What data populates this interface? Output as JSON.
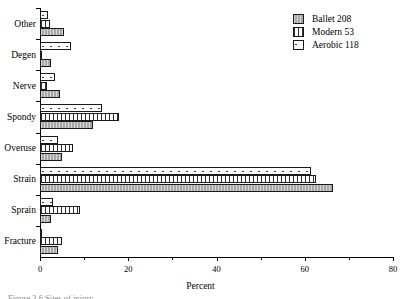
{
  "chart_data": {
    "type": "bar",
    "orientation": "horizontal",
    "title": "",
    "xlabel": "Percent",
    "ylabel": "",
    "xlim": [
      0,
      80
    ],
    "xticks": [
      0,
      20,
      40,
      60,
      80
    ],
    "xtick_labels": [
      "0",
      "20",
      "40",
      "60",
      "80"
    ],
    "minor_ticks": [
      10,
      30,
      50,
      70
    ],
    "grid": false,
    "legend_position": "top-right",
    "categories": [
      "Fracture",
      "Sprain",
      "Strain",
      "Overuse",
      "Spondy",
      "Nerve",
      "Degen",
      "Other"
    ],
    "series": [
      {
        "name": "Ballet 208",
        "label": "Ballet 208",
        "n": 208,
        "fill": "solid-gray",
        "values": [
          4.0,
          2.5,
          66.5,
          5.0,
          12.0,
          4.5,
          2.5,
          5.5
        ]
      },
      {
        "name": "Modern 53",
        "label": "Modern 53",
        "n": 53,
        "fill": "vertical-lines",
        "values": [
          5.0,
          9.0,
          62.5,
          7.5,
          18.0,
          1.5,
          0.2,
          2.2
        ]
      },
      {
        "name": "Aerobic 118",
        "label": "Aerobic 118",
        "n": 118,
        "fill": "white-dotted",
        "values": [
          0.5,
          3.0,
          61.5,
          4.0,
          14.0,
          3.5,
          7.0,
          1.8
        ]
      }
    ]
  },
  "legend": {
    "items": [
      {
        "label": "Ballet 208",
        "swatch": "solid-gray"
      },
      {
        "label": "Modern 53",
        "swatch": "vertical-lines"
      },
      {
        "label": "Aerobic 118",
        "swatch": "white-dotted"
      }
    ]
  },
  "axis": {
    "x_title": "Percent"
  },
  "caption": {
    "text": "Figure 3.6  Sites of injury"
  },
  "colors": {
    "ballet": "#a8a8a8",
    "modern": "#ffffff",
    "aerobic": "#ffffff",
    "outline": "#1a1a1a",
    "axis": "#000000"
  }
}
